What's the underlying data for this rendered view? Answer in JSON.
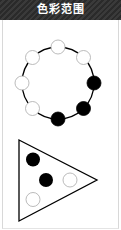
{
  "header": {
    "title": "色彩范围"
  },
  "figures": {
    "circle": {
      "shape": "circle",
      "nodes": [
        {
          "position": "top",
          "fill": "white"
        },
        {
          "position": "top-right",
          "fill": "white"
        },
        {
          "position": "right",
          "fill": "black"
        },
        {
          "position": "bottom-right",
          "fill": "black"
        },
        {
          "position": "bottom",
          "fill": "black"
        },
        {
          "position": "bottom-left",
          "fill": "white"
        },
        {
          "position": "left",
          "fill": "white"
        },
        {
          "position": "top-left",
          "fill": "white"
        }
      ]
    },
    "triangle": {
      "shape": "triangle",
      "nodes": [
        {
          "position": "upper-left",
          "fill": "black"
        },
        {
          "position": "center",
          "fill": "black"
        },
        {
          "position": "right",
          "fill": "white"
        },
        {
          "position": "lower-left",
          "fill": "white"
        }
      ]
    }
  },
  "colors": {
    "header_bg": "#2f2f2f",
    "header_text": "#ffffff",
    "stroke": "#000000",
    "filled": "#000000",
    "empty": "#ffffff"
  }
}
